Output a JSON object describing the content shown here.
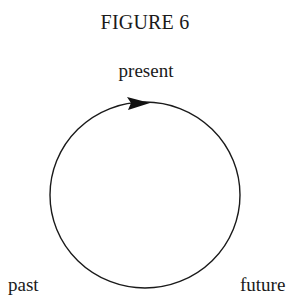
{
  "figure": {
    "title": "FIGURE 6",
    "labels": {
      "top": "present",
      "bottom_left": "past",
      "bottom_right": "future"
    },
    "cycle": {
      "shape": "circle",
      "direction": "clockwise",
      "arrow_position": "top",
      "stroke_color": "#1a1a1a"
    }
  }
}
